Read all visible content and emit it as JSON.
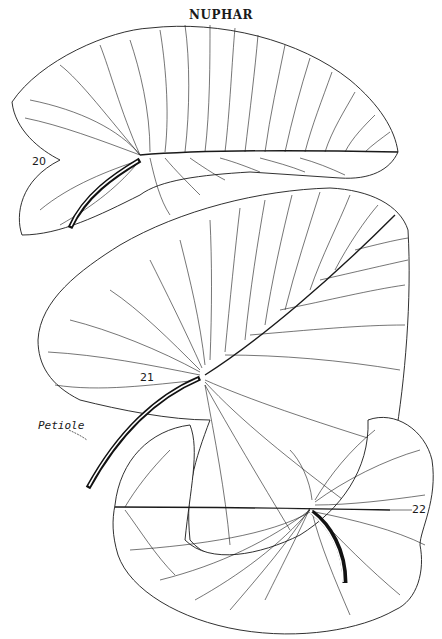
{
  "title": "NUPHAR",
  "figures": [
    {
      "id": "20",
      "label": "20",
      "description": "Nuphar leaf, upper view, sagittate with midrib and petiole"
    },
    {
      "id": "21",
      "label": "21",
      "description": "Nuphar leaf, tilted, with long petiole"
    },
    {
      "id": "22",
      "label": "22",
      "description": "Nuphar leaf, rounded, with short curved petiole"
    }
  ],
  "annotations": {
    "petiole": "Petiole"
  },
  "colors": {
    "ink": "#1a1a1a",
    "paper": "#ffffff"
  }
}
